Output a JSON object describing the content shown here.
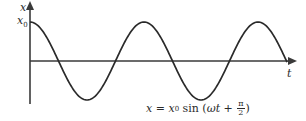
{
  "chart_data": {
    "type": "line",
    "title": "",
    "xlabel": "t",
    "ylabel": "x",
    "y_tick_label": "x0",
    "equation": "x = x0 sin (ωt + π/2)",
    "function": "x0*sin(omega*t + pi/2)",
    "amplitude_label": "x0",
    "phase": "π/2",
    "grid": false,
    "legend": null,
    "x": [
      0,
      0.25,
      0.5,
      0.75,
      1.0,
      1.25,
      1.5,
      1.75,
      2.0,
      2.25,
      2.5
    ],
    "x_units": "periods (T)",
    "values": [
      1,
      0,
      -1,
      0,
      1,
      0,
      -1,
      0,
      1,
      0,
      -1
    ],
    "y_units": "x0",
    "ylim": [
      -1,
      1
    ]
  },
  "axes": {
    "y_label": "x",
    "y_tick": "x",
    "y_tick_sub": "0",
    "x_label": "t"
  },
  "equation": {
    "lhs": "x",
    "eq": " = ",
    "x0": "x",
    "x0_sub": "0",
    "fn": " sin (",
    "omega_t": "ωt",
    "plus": " + ",
    "pi": "π",
    "two": "2",
    "close": ")"
  },
  "colors": {
    "curve": "#2a2a2a",
    "axis": "#3a3a3a",
    "background": "#ffffff"
  }
}
